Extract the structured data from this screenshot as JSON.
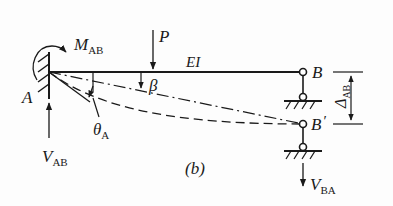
{
  "diagram": {
    "type": "structural-beam-deflection",
    "caption": "(b)",
    "labels": {
      "moment": {
        "main": "M",
        "sub": "AB"
      },
      "load": "P",
      "stiffness": "EI",
      "node_a": "A",
      "node_b": "B",
      "node_b_prime": "B",
      "prime_mark": "′",
      "chord_angle": "β",
      "rotation": {
        "main": "θ",
        "sub": "A"
      },
      "displacement": {
        "main": "Δ",
        "sub": "AB"
      },
      "reaction_a": {
        "main": "V",
        "sub": "AB"
      },
      "reaction_b": {
        "main": "V",
        "sub": "BA"
      }
    },
    "colors": {
      "ink": "#1a1a1a",
      "background": "#fdfdfd"
    }
  }
}
